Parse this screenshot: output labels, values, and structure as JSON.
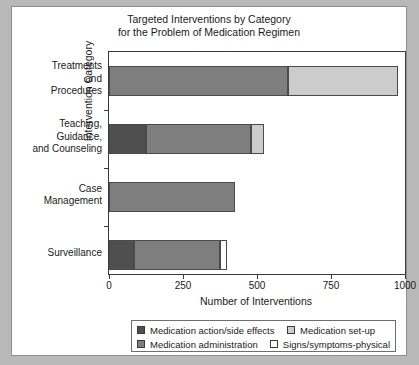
{
  "chart_data": {
    "type": "bar",
    "orientation": "horizontal",
    "stacked": true,
    "title": "Targeted Interventions by Category",
    "subtitle": "for the Problem of Medication Regimen",
    "xlabel": "Number of Interventions",
    "ylabel": "Intervention Category",
    "xlim": [
      0,
      1000
    ],
    "xticks": [
      0,
      250,
      500,
      750,
      1000
    ],
    "xticklabels": [
      "0",
      "250",
      "500",
      "750",
      "1000"
    ],
    "grid": false,
    "legend_position": "bottom",
    "categories": [
      "Treatments and Procedures",
      "Teaching, Guidance, and Counseling",
      "Case Management",
      "Surveillance"
    ],
    "category_lines": [
      [
        "Treatments",
        "and",
        "Procedures"
      ],
      [
        "Teaching,",
        "Guidance,",
        "and Counseling"
      ],
      [
        "Case",
        "Management"
      ],
      [
        "Surveillance"
      ]
    ],
    "series": [
      {
        "name": "Medication action/side effects",
        "color": "#4f4f4f",
        "values": [
          0,
          125,
          0,
          85
        ]
      },
      {
        "name": "Medication administration",
        "color": "#7e7e7e",
        "values": [
          605,
          355,
          425,
          290
        ]
      },
      {
        "name": "Medication set-up",
        "color": "#cccccc",
        "values": [
          370,
          45,
          0,
          0
        ]
      },
      {
        "name": "Signs/symptoms-physical",
        "color": "#ffffff",
        "values": [
          0,
          0,
          0,
          25
        ]
      }
    ],
    "totals": [
      975,
      525,
      425,
      400
    ]
  },
  "legend": {
    "entries": [
      {
        "label": "Medication action/side effects",
        "color": "#4f4f4f"
      },
      {
        "label": "Medication set-up",
        "color": "#cccccc"
      },
      {
        "label": "Medication administration",
        "color": "#7e7e7e"
      },
      {
        "label": "Signs/symptoms-physical",
        "color": "#ffffff"
      }
    ]
  },
  "colors": {
    "figure_background": "#ffffff",
    "page_background": "#b9b9b9",
    "axis": "#3a3a3a",
    "text": "#1a1a1a"
  }
}
